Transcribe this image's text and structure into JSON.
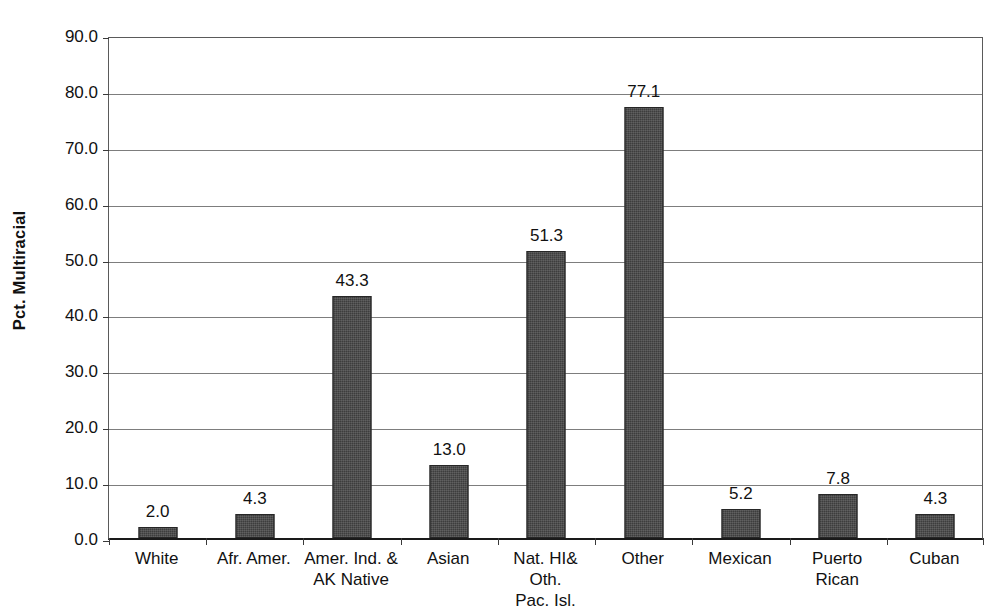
{
  "chart_data": {
    "type": "bar",
    "title": "",
    "xlabel": "",
    "ylabel": "Pct. Multiracial",
    "ylim": [
      0.0,
      90.0
    ],
    "ytick_step": 10.0,
    "grid": true,
    "legend": "none",
    "bar_color": "#3d3d3d",
    "categories": [
      "White",
      "Afr. Amer.",
      "Amer. Ind. & AK Native",
      "Asian",
      "Nat. HI& Oth. Pac. Isl.",
      "Other",
      "Mexican",
      "Puerto Rican",
      "Cuban"
    ],
    "category_lines": [
      [
        "White"
      ],
      [
        "Afr. Amer."
      ],
      [
        "Amer. Ind. &",
        "AK Native"
      ],
      [
        "Asian"
      ],
      [
        "Nat. HI& Oth.",
        "Pac. Isl."
      ],
      [
        "Other"
      ],
      [
        "Mexican"
      ],
      [
        "Puerto Rican"
      ],
      [
        "Cuban"
      ]
    ],
    "values": [
      2.0,
      4.3,
      43.3,
      13.0,
      51.3,
      77.1,
      5.2,
      7.8,
      4.3
    ],
    "data_labels": [
      "2.0",
      "4.3",
      "43.3",
      "13.0",
      "51.3",
      "77.1",
      "5.2",
      "7.8",
      "4.3"
    ],
    "ytick_labels": [
      "90.0",
      "80.0",
      "70.0",
      "60.0",
      "50.0",
      "40.0",
      "30.0",
      "20.0",
      "10.0",
      "0.0"
    ],
    "ytick_values": [
      90.0,
      80.0,
      70.0,
      60.0,
      50.0,
      40.0,
      30.0,
      20.0,
      10.0,
      0.0
    ]
  }
}
